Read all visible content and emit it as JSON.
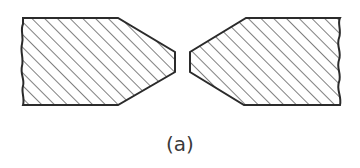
{
  "figure": {
    "caption": "(a)",
    "stroke_color": "#2b2b2b",
    "hatch_color": "#3a3a3a",
    "background": "#ffffff",
    "pieces": [
      {
        "name": "left-piece",
        "outline": "M23,18 L118,18 L175,52 L175,72 L118,105 L23,105 C25,98 21,92 23,86 C25,80 20,74 22,66 C24,58 20,52 22,44 C24,36 20,30 23,24 Z"
      },
      {
        "name": "right-piece",
        "outline": "M246,18 L340,18 C337,24 342,30 339,38 C336,46 342,52 339,60 C336,68 342,74 339,82 C336,90 342,96 340,105 L244,105 L190,72 L190,52 Z"
      }
    ]
  }
}
